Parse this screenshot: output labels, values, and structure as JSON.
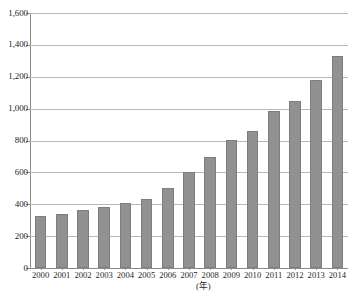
{
  "chart_data": {
    "type": "bar",
    "title": "",
    "subtitle": "",
    "xlabel": "(年)",
    "ylabel": "",
    "categories": [
      "2000",
      "2001",
      "2002",
      "2003",
      "2004",
      "2005",
      "2006",
      "2007",
      "2008",
      "2009",
      "2010",
      "2011",
      "2012",
      "2013",
      "2014"
    ],
    "values": [
      325,
      338,
      363,
      385,
      407,
      435,
      503,
      600,
      698,
      803,
      858,
      985,
      1045,
      1178,
      1330
    ],
    "series": [
      {
        "name": "",
        "values": [
          325,
          338,
          363,
          385,
          407,
          435,
          503,
          600,
          698,
          803,
          858,
          985,
          1045,
          1178,
          1330
        ]
      }
    ],
    "ylim": [
      0,
      1600
    ],
    "xlim_categories": 15,
    "ytick_values": [
      0,
      200,
      400,
      600,
      800,
      1000,
      1200,
      1400,
      1600
    ],
    "ytick_labels": [
      "0",
      "200",
      "400",
      "600",
      "800",
      "1,000",
      "1,200",
      "1,400",
      "1,600"
    ],
    "grid": true,
    "grid_axis": "y",
    "legend": false,
    "legend_position": "none",
    "bar_color": "#919191",
    "bar_border_color": "#7d7d7d",
    "gridline_color": "#b9b9b9",
    "axis_color": "#8d8d8d",
    "background_color": "#ffffff",
    "annotations": []
  },
  "axis": {
    "x_unit_label": "(年)"
  },
  "footer": {
    "source_note": ""
  }
}
